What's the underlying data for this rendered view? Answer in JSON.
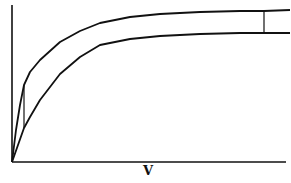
{
  "figure": {
    "type": "line",
    "xlabel": "V",
    "ylabel": "",
    "stroke_color": "#111111",
    "background": "#ffffff"
  },
  "chart_data": {
    "type": "line",
    "title": "",
    "xlabel": "V",
    "ylabel": "",
    "grid": false,
    "legend": null,
    "series": [
      {
        "name": "upper curve",
        "description": "saturating (hyperbolic) curve, higher asymptote",
        "points_px": [
          [
            12,
            162
          ],
          [
            16,
            130
          ],
          [
            20,
            105
          ],
          [
            24,
            85
          ],
          [
            30,
            72
          ],
          [
            40,
            60
          ],
          [
            60,
            42
          ],
          [
            80,
            31
          ],
          [
            100,
            23
          ],
          [
            130,
            17
          ],
          [
            160,
            14
          ],
          [
            200,
            12
          ],
          [
            240,
            11
          ],
          [
            264,
            11
          ],
          [
            290,
            10
          ]
        ]
      },
      {
        "name": "lower curve",
        "description": "saturating (hyperbolic) curve, lower asymptote",
        "points_px": [
          [
            12,
            162
          ],
          [
            18,
            145
          ],
          [
            24,
            128
          ],
          [
            30,
            117
          ],
          [
            40,
            100
          ],
          [
            60,
            74
          ],
          [
            80,
            57
          ],
          [
            100,
            45
          ],
          [
            130,
            39
          ],
          [
            160,
            36
          ],
          [
            200,
            34
          ],
          [
            240,
            33
          ],
          [
            264,
            33
          ],
          [
            290,
            33
          ]
        ]
      }
    ],
    "annotations": [
      {
        "type": "vertical-connector",
        "x_px": 24,
        "from_y_px": 85,
        "to_y_px": 128,
        "note": "gap between curves at low V"
      },
      {
        "type": "vertical-connector",
        "x_px": 264,
        "from_y_px": 11,
        "to_y_px": 33,
        "note": "gap between curves at high V"
      }
    ],
    "axes": {
      "x": {
        "from_px": 12,
        "to_px": 286,
        "y_px": 162,
        "ticks": []
      },
      "y": {
        "x_px": 12,
        "from_px": 162,
        "to_px": 5,
        "ticks": []
      }
    }
  }
}
